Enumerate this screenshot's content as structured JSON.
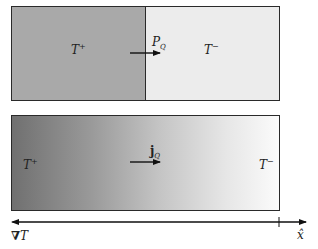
{
  "diagram": {
    "top_panel": {
      "left_region": {
        "label_base": "T",
        "label_sup": "+",
        "fill": "#a9a9a9"
      },
      "right_region": {
        "label_base": "T",
        "label_sup": "−",
        "fill": "#ececec"
      },
      "flux_arrow": {
        "label_base": "P",
        "label_sub": "Q",
        "direction": "right"
      }
    },
    "bottom_panel": {
      "gradient": {
        "from": "#707070",
        "to": "#fbfbfb"
      },
      "left_label": {
        "base": "T",
        "sup": "+"
      },
      "right_label": {
        "base": "T",
        "sup": "−"
      },
      "flux_arrow": {
        "label_base": "j",
        "label_sub": "Q",
        "direction": "right"
      }
    },
    "axis": {
      "left_label_symbol": "∇",
      "left_label_base": "T",
      "right_label": "x̂",
      "left_arrow_direction": "left",
      "right_arrow_direction": "right"
    }
  }
}
